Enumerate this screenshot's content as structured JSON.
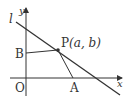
{
  "diagram": {
    "labels": {
      "line": "l",
      "y_axis": "y",
      "x_axis": "x",
      "origin": "O",
      "point_b": "B",
      "point_a": "A",
      "point_p": "P",
      "point_p_coords": "(a, b)"
    },
    "colors": {
      "stroke": "#333333",
      "background": "#ffffff"
    },
    "points": {
      "O": [
        26,
        78
      ],
      "P": [
        58,
        50
      ],
      "A": [
        73,
        78
      ],
      "B": [
        26,
        53
      ]
    }
  }
}
